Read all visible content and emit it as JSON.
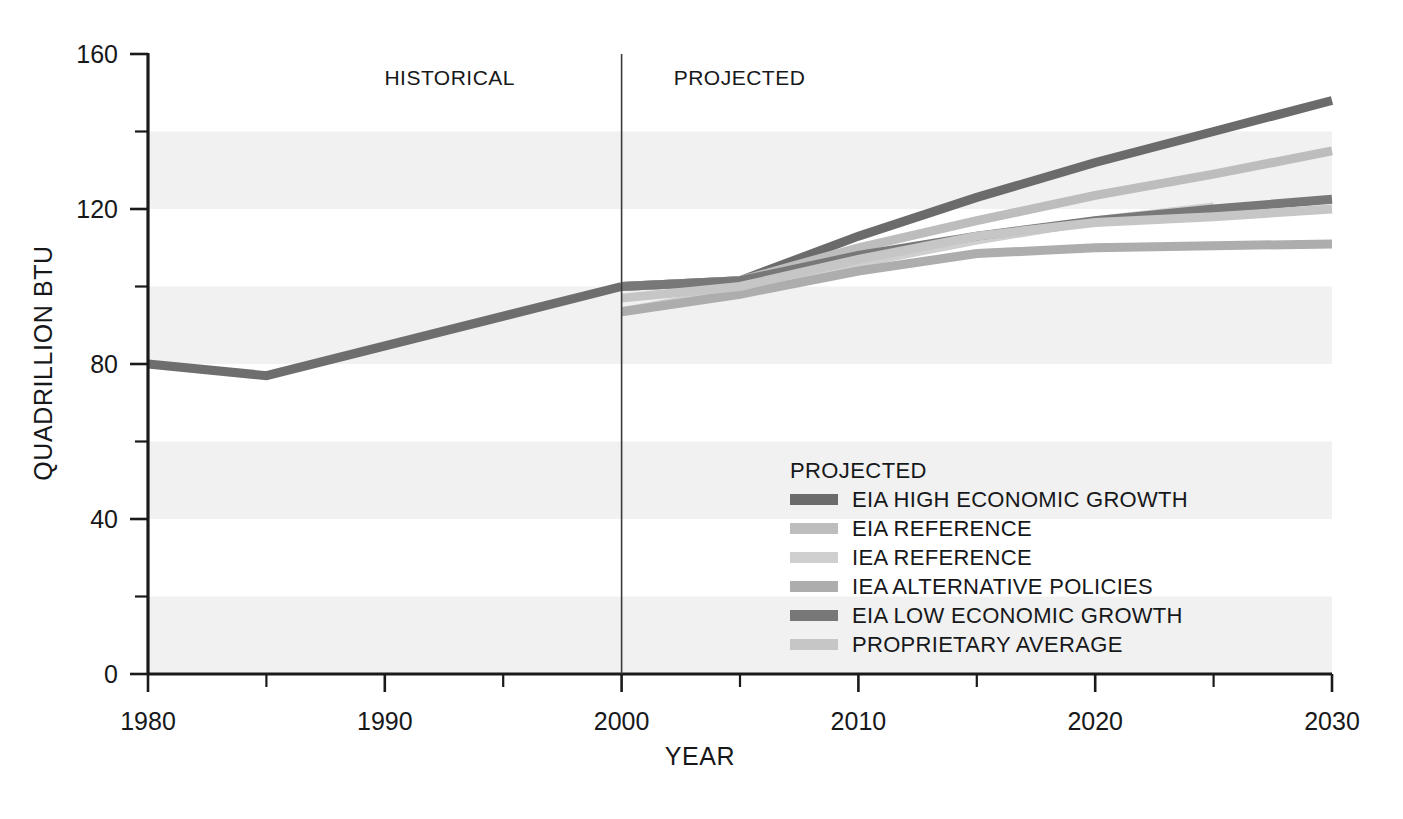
{
  "chart_data": {
    "type": "line",
    "title": "",
    "xlabel": "YEAR",
    "ylabel": "QUADRILLION BTU",
    "xlim": [
      1980,
      2030
    ],
    "ylim": [
      0,
      160
    ],
    "x_ticks": [
      "1980",
      "1990",
      "2000",
      "2010",
      "2020",
      "2030"
    ],
    "x_tick_values": [
      1980,
      1990,
      2000,
      2010,
      2020,
      2030
    ],
    "x_minor_values": [
      1985,
      1995,
      2005,
      2015,
      2025
    ],
    "y_ticks": [
      "0",
      "40",
      "80",
      "120",
      "160"
    ],
    "y_tick_values": [
      0,
      40,
      80,
      120,
      160
    ],
    "y_minor_values": [
      20,
      60,
      100,
      140
    ],
    "grid": "horizontal-bands",
    "band_color": "#f1f1f1",
    "legend_position": "inside-lower-right",
    "annotations": [
      {
        "name": "historical-label",
        "text": "HISTORICAL",
        "x": 1995.5,
        "y": 152
      },
      {
        "name": "projected-label",
        "text": "PROJECTED",
        "x": 2002.2,
        "y": 152
      },
      {
        "name": "divider-year",
        "value": 2000
      }
    ],
    "series": [
      {
        "name": "HISTORICAL",
        "legend": false,
        "color": "#6e6e6e",
        "width": 9,
        "x": [
          1980,
          1985,
          2000
        ],
        "values": [
          80,
          77,
          100
        ]
      },
      {
        "name": "EIA HIGH ECONOMIC GROWTH",
        "legend": true,
        "color": "#6b6b6b",
        "width": 9,
        "x": [
          2000,
          2005,
          2010,
          2015,
          2020,
          2025,
          2030
        ],
        "values": [
          100,
          101.5,
          113,
          123,
          132,
          140,
          148
        ]
      },
      {
        "name": "EIA REFERENCE",
        "legend": true,
        "color": "#bdbdbd",
        "width": 9,
        "x": [
          2000,
          2005,
          2010,
          2015,
          2020,
          2025,
          2030
        ],
        "values": [
          100,
          101.5,
          110,
          117,
          123.5,
          129,
          135
        ]
      },
      {
        "name": "IEA REFERENCE",
        "legend": true,
        "color": "#cfcfcf",
        "width": 9,
        "x": [
          2000,
          2005,
          2010,
          2015,
          2020,
          2025
        ],
        "values": [
          93.5,
          99,
          106,
          112,
          117,
          120.5
        ]
      },
      {
        "name": "IEA ALTERNATIVE POLICIES",
        "legend": true,
        "color": "#adadad",
        "width": 9,
        "x": [
          2000,
          2005,
          2010,
          2015,
          2020,
          2025,
          2030
        ],
        "values": [
          93.5,
          98,
          104,
          108.5,
          110,
          110.5,
          111
        ]
      },
      {
        "name": "EIA LOW ECONOMIC GROWTH",
        "legend": true,
        "color": "#787878",
        "width": 9,
        "x": [
          2000,
          2005,
          2010,
          2015,
          2020,
          2025,
          2030
        ],
        "values": [
          100,
          101.5,
          108,
          113,
          117,
          120,
          122.5
        ]
      },
      {
        "name": "PROPRIETARY AVERAGE",
        "legend": true,
        "color": "#c6c6c6",
        "width": 9,
        "x": [
          2000,
          2005,
          2010,
          2015,
          2020,
          2025,
          2030
        ],
        "values": [
          97,
          100,
          107,
          113,
          116.5,
          118,
          120
        ]
      }
    ]
  },
  "legend": {
    "title": "PROJECTED",
    "items": [
      {
        "label": "EIA HIGH ECONOMIC GROWTH",
        "color": "#6b6b6b"
      },
      {
        "label": "EIA REFERENCE",
        "color": "#bdbdbd"
      },
      {
        "label": "IEA REFERENCE",
        "color": "#cfcfcf"
      },
      {
        "label": "IEA ALTERNATIVE POLICIES",
        "color": "#adadad"
      },
      {
        "label": "EIA LOW ECONOMIC GROWTH",
        "color": "#787878"
      },
      {
        "label": "PROPRIETARY AVERAGE",
        "color": "#c6c6c6"
      }
    ]
  },
  "colors": {
    "axis": "#1a1a1a",
    "text": "#17181a",
    "band": "#f1f1f1",
    "background": "#ffffff"
  }
}
